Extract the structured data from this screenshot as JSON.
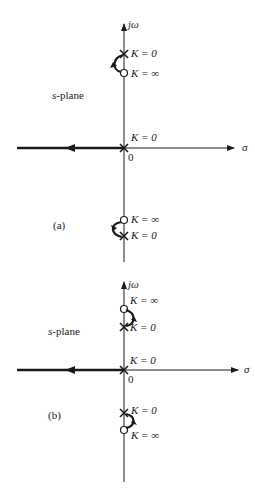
{
  "figure": {
    "panels": [
      {
        "id": "a",
        "caption": "(a)",
        "plane_label": "s-plane",
        "axis_labels": {
          "imag": "jω",
          "real": "σ",
          "origin": "0"
        },
        "upper": {
          "pole_label": "K = 0",
          "zero_label": "K = ∞"
        },
        "origin_label": "K = 0",
        "lower": {
          "zero_label": "K = ∞",
          "pole_label": "K = 0"
        }
      },
      {
        "id": "b",
        "caption": "(b)",
        "plane_label": "s-plane",
        "axis_labels": {
          "imag": "jω",
          "real": "σ",
          "origin": "0"
        },
        "upper": {
          "zero_label": "K = ∞",
          "pole_label": "K = 0"
        },
        "origin_label": "K = 0",
        "lower": {
          "pole_label": "K = 0",
          "zero_label": "K = ∞"
        }
      }
    ],
    "colors": {
      "ink": "#1a1a1a",
      "background": "#ffffff"
    }
  }
}
